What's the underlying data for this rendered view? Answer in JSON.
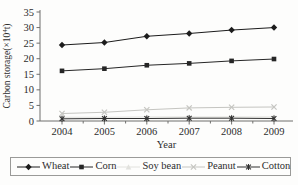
{
  "chart_data": {
    "type": "line",
    "title": "",
    "xlabel": "Year",
    "ylabel": "Carbon storage(×10⁴t)",
    "ylabel_parts": {
      "prefix": "Carbon storage(×10",
      "exponent": "4",
      "suffix": "t)"
    },
    "x": [
      2004,
      2005,
      2006,
      2007,
      2008,
      2009
    ],
    "ylim": [
      0,
      35
    ],
    "y_ticks": [
      0,
      5,
      10,
      15,
      20,
      25,
      30,
      35
    ],
    "grid": false,
    "legend_position": "bottom",
    "axis_color": "#6f6f6d",
    "text_color": "#2c2c2c",
    "series": [
      {
        "name": "Wheat",
        "marker": "diamond",
        "color": "#1c1c1c",
        "values": [
          24.4,
          25.2,
          27.2,
          28.1,
          29.2,
          30.0
        ]
      },
      {
        "name": "Corn",
        "marker": "square",
        "color": "#262626",
        "values": [
          16.1,
          16.8,
          17.9,
          18.5,
          19.3,
          19.9
        ]
      },
      {
        "name": "Soy bean",
        "marker": "triangle",
        "color": "#e2e2de",
        "values": [
          1.2,
          1.2,
          1.3,
          1.3,
          1.3,
          1.3
        ]
      },
      {
        "name": "Peanut",
        "marker": "x",
        "color": "#c5c5c1",
        "values": [
          2.4,
          2.8,
          3.6,
          4.2,
          4.4,
          4.5
        ]
      },
      {
        "name": "Cotton",
        "marker": "asterisk",
        "color": "#303030",
        "values": [
          0.7,
          0.8,
          0.8,
          0.9,
          0.9,
          0.8
        ]
      }
    ]
  }
}
